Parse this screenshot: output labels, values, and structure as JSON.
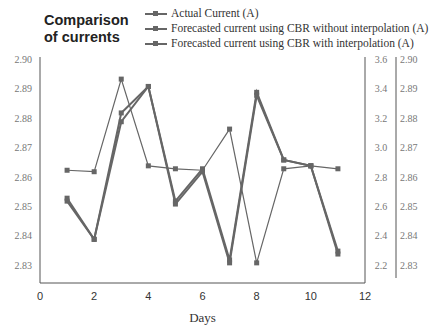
{
  "chart_data": {
    "type": "line",
    "title": "Comparison of currents",
    "title_lines": [
      "Comparison",
      "of currents"
    ],
    "xlabel": "Days",
    "ylabel": "",
    "xlim": [
      0,
      12
    ],
    "x_ticks": [
      "0",
      "2",
      "4",
      "6",
      "8",
      "10",
      "12"
    ],
    "y_left": {
      "range": [
        2.824,
        2.9
      ],
      "ticks": [
        "2.90",
        "2.89",
        "2.88",
        "2.87",
        "2.86",
        "2.85",
        "2.84",
        "2.83"
      ]
    },
    "y_right_inner": {
      "range": [
        2.1,
        3.6
      ],
      "ticks": [
        "3.6",
        "3.4",
        "3.2",
        "3.0",
        "2.8",
        "2.6",
        "2.4",
        "2.2"
      ]
    },
    "y_right_outer": {
      "range": [
        2.824,
        2.9
      ],
      "ticks": [
        "2.90",
        "2.89",
        "2.88",
        "2.87",
        "2.86",
        "2.85",
        "2.84",
        "2.83"
      ]
    },
    "x": [
      1,
      2,
      3,
      4,
      5,
      6,
      7,
      8,
      9,
      10,
      11
    ],
    "series": [
      {
        "name": "Actual Current (A)",
        "axis": "left",
        "values": [
          2.853,
          2.839,
          2.882,
          2.891,
          2.852,
          2.863,
          2.832,
          2.889,
          2.866,
          2.864,
          2.835
        ]
      },
      {
        "name": "Forecasted current using CBR without interpolation (A)",
        "axis": "right_inner",
        "values": [
          2.85,
          2.84,
          3.47,
          2.88,
          2.86,
          2.85,
          3.13,
          2.22,
          2.86,
          2.88,
          2.86
        ]
      },
      {
        "name": "Forecasted current using CBR with interpolation (A)",
        "axis": "right_outer",
        "values": [
          2.852,
          2.839,
          2.879,
          2.891,
          2.851,
          2.862,
          2.831,
          2.888,
          2.866,
          2.864,
          2.834
        ]
      }
    ],
    "legend_position": "top",
    "grid": false,
    "colors": {
      "line": "#666666",
      "axis": "#555555"
    }
  }
}
